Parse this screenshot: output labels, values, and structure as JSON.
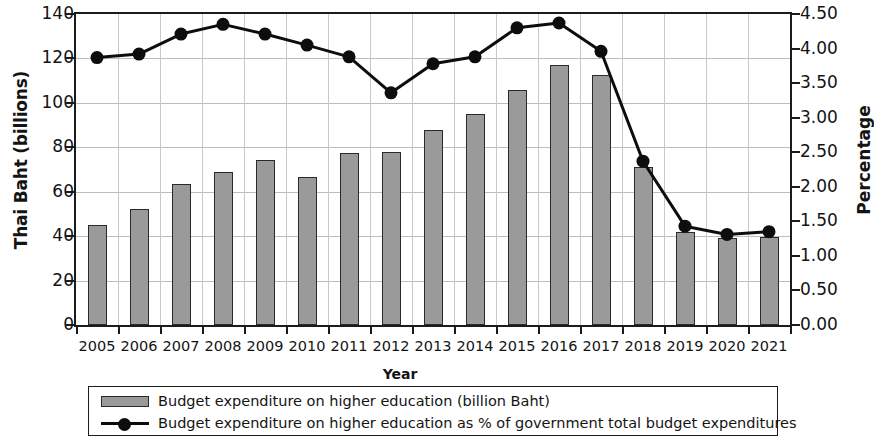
{
  "chart_data": {
    "type": "bar",
    "title": "",
    "xlabel": "Year",
    "ylabel": "Thai Baht (billions)",
    "ylabel_secondary": "Percentage",
    "categories": [
      "2005",
      "2006",
      "2007",
      "2008",
      "2009",
      "2010",
      "2011",
      "2012",
      "2013",
      "2014",
      "2015",
      "2016",
      "2017",
      "2018",
      "2019",
      "2020",
      "2021"
    ],
    "ylim": [
      0,
      140
    ],
    "ylim_secondary": [
      0,
      4.5
    ],
    "yticks": [
      "0",
      "20",
      "40",
      "60",
      "80",
      "100",
      "120",
      "140"
    ],
    "yticks_secondary": [
      "0.00",
      "0.50",
      "1.00",
      "1.50",
      "2.00",
      "2.50",
      "3.00",
      "3.50",
      "4.00",
      "4.50"
    ],
    "grid": true,
    "legend_position": "bottom",
    "series": [
      {
        "name": "Budget expenditure on higher education (billion Baht)",
        "type": "bar",
        "axis": "left",
        "color": "#9a9a9a",
        "values": [
          45,
          52,
          63.5,
          69,
          74.5,
          66.5,
          77.5,
          78,
          88,
          95,
          106,
          117,
          112.5,
          71,
          42,
          39,
          39.5
        ]
      },
      {
        "name": "Budget expenditure on higher education as % of government total budget expenditures",
        "type": "line",
        "axis": "right",
        "color": "#0d0d0d",
        "values": [
          3.87,
          3.92,
          4.21,
          4.35,
          4.21,
          4.05,
          3.88,
          3.36,
          3.78,
          3.88,
          4.3,
          4.37,
          3.96,
          2.37,
          1.43,
          1.31,
          1.35
        ]
      }
    ]
  },
  "legend": {
    "items": [
      {
        "label": "Budget expenditure on higher education (billion Baht)",
        "marker": "bar-swatch"
      },
      {
        "label": "Budget expenditure on higher education as % of government total budget expenditures",
        "marker": "line-marker-swatch"
      }
    ]
  }
}
